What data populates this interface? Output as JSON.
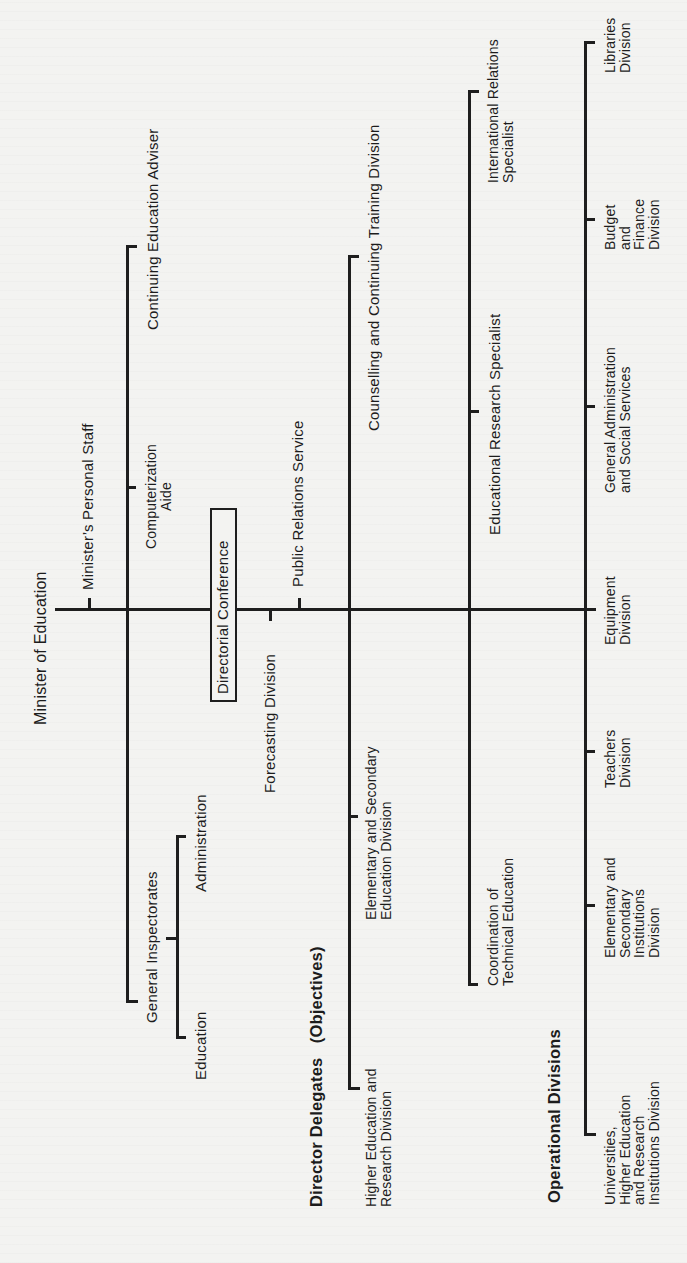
{
  "chart": {
    "title": "Minister of Education",
    "orientation": "rotated -90deg (reads bottom to top)",
    "top": {
      "minister": "Minister of Education",
      "ministers_staff": "Minister’s Personal Staff",
      "directorial_conference": "Directorial Conference",
      "forecasting": "Forecasting Division",
      "public_relations": "Public Relations Service"
    },
    "advisory_column": {
      "computerization": "Computerization\nAide",
      "continuing_education": "Continuing Education Adviser",
      "general_inspectorates": "General Inspectorates",
      "education": "Education",
      "administration": "Administration"
    },
    "director_delegates": {
      "heading": "Director Delegates   (Objectives)",
      "items": [
        "Higher Education and\nResearch Division",
        "Elementary and Secondary\nEducation Division",
        "Counselling and Continuing Training Division"
      ]
    },
    "specialists": {
      "items": [
        "Coordination of\nTechnical Education",
        "Educational Research Specialist",
        "International Relations\nSpecialist"
      ]
    },
    "operational_divisions": {
      "heading": "Operational Divisions",
      "items": [
        "Universities,\nHigher Education\nand Research\nInstitutions Division",
        "Elementary and\nSecondary\nInstitutions\nDivision",
        "Teachers\nDivision",
        "Equipment\nDivision",
        "General Administration\nand Social Services",
        "Budget\nand\nFinance\nDivision",
        "Libraries\nDivision"
      ]
    }
  }
}
